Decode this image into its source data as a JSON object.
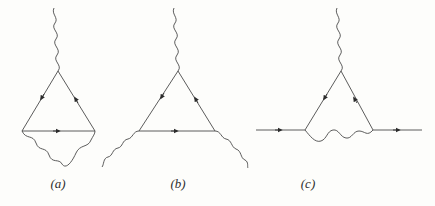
{
  "figure": {
    "background_color": "#fdfdfb",
    "line_color": "#4a4a4a",
    "arrow_color": "#2b2b2b",
    "width": 435,
    "height": 206
  },
  "diagrams": [
    {
      "id": "a",
      "label": "(a)",
      "caption_x": 58,
      "caption_y": 182,
      "fermion_loop": {
        "apex": [
          58,
          71
        ],
        "bottom_left": [
          22,
          131
        ],
        "bottom_right": [
          95,
          131
        ],
        "arrow_count": 3
      },
      "photons": [
        {
          "name": "external-photon-top",
          "shape": "vertical-wavy",
          "from": [
            58,
            71
          ],
          "to": [
            54,
            8
          ]
        },
        {
          "name": "internal-photon-arc",
          "shape": "arc-wavy-below",
          "from": [
            22,
            131
          ],
          "to": [
            95,
            131
          ],
          "sag": 34
        }
      ]
    },
    {
      "id": "b",
      "label": "(b)",
      "caption_x": 178,
      "caption_y": 182,
      "fermion_loop": {
        "apex": [
          178,
          71
        ],
        "bottom_left": [
          139,
          131
        ],
        "bottom_right": [
          215,
          131
        ],
        "arrow_count": 3
      },
      "photons": [
        {
          "name": "external-photon-top",
          "shape": "vertical-wavy",
          "from": [
            178,
            71
          ],
          "to": [
            174,
            8
          ]
        },
        {
          "name": "external-photon-lower-left",
          "shape": "diagonal-wavy",
          "from": [
            139,
            131
          ],
          "to": [
            102,
            167
          ]
        },
        {
          "name": "external-photon-lower-right",
          "shape": "diagonal-wavy",
          "from": [
            215,
            131
          ],
          "to": [
            248,
            168
          ]
        }
      ]
    },
    {
      "id": "c",
      "label": "(c)",
      "caption_x": 308,
      "caption_y": 182,
      "fermion_loop": {
        "apex": [
          341,
          71
        ],
        "bottom_left": [
          305,
          130
        ],
        "bottom_right": [
          373,
          130
        ],
        "arrow_count": 2
      },
      "fermion_lines": [
        {
          "name": "incoming-fermion-line",
          "from": [
            256,
            130
          ],
          "to": [
            305,
            130
          ],
          "arrow_at": 0.55,
          "direction": "right"
        },
        {
          "name": "outgoing-fermion-line",
          "from": [
            373,
            130
          ],
          "to": [
            422,
            130
          ],
          "arrow_at": 0.55,
          "direction": "right"
        }
      ],
      "photons": [
        {
          "name": "external-photon-top",
          "shape": "vertical-wavy",
          "from": [
            341,
            71
          ],
          "to": [
            337,
            8
          ]
        },
        {
          "name": "internal-photon-arc",
          "shape": "arc-wavy-below",
          "from": [
            305,
            130
          ],
          "to": [
            373,
            130
          ],
          "sag": 16
        }
      ]
    }
  ]
}
